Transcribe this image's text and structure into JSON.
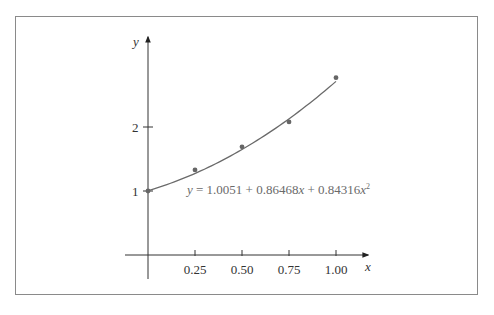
{
  "chart_data": {
    "type": "scatter",
    "title": "",
    "xlabel": "x",
    "ylabel": "y",
    "xlim": [
      0,
      1.1
    ],
    "ylim": [
      0,
      3
    ],
    "grid": false,
    "x_ticks": [
      "0.25",
      "0.50",
      "0.75",
      "1.00"
    ],
    "y_ticks": [
      "1",
      "2"
    ],
    "series": [
      {
        "name": "data points",
        "type": "scatter",
        "x": [
          0,
          0.25,
          0.5,
          0.75,
          1.0
        ],
        "y": [
          1.0,
          1.33,
          1.69,
          2.08,
          2.77
        ]
      },
      {
        "name": "quadratic fit",
        "type": "line",
        "equation": "y = 1.0051 + 0.86468x + 0.84316x^2",
        "coefficients": [
          1.0051,
          0.86468,
          0.84316
        ]
      }
    ],
    "annotation": {
      "prefix": "y",
      "eq_sign": " = 1.0051 + 0.86468",
      "x1": "x",
      "mid": " + 0.84316",
      "x2": "x",
      "sup": "2"
    },
    "colors": {
      "axis": "#333333",
      "curve": "#6a6a6a",
      "points": "#666666",
      "frame": "#8a8a8a"
    }
  }
}
